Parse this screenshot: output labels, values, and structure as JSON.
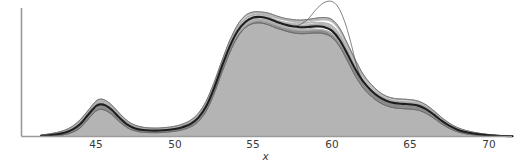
{
  "chart_data": {
    "type": "area",
    "title": "",
    "subtitle": "",
    "xlabel": "x",
    "ylabel": "",
    "xlim": [
      41.5,
      71.5
    ],
    "ylim": [
      0,
      1.0
    ],
    "xticks": [
      45,
      50,
      55,
      60,
      65,
      70
    ],
    "xtick_labels": [
      "45",
      "50",
      "55",
      "60",
      "65",
      "70"
    ],
    "yticks": [],
    "ytick_labels": [],
    "grid": false,
    "legend": null,
    "annotations": [],
    "series": [
      {
        "name": "median density",
        "role": "central-curve",
        "color": "#1e1e1e",
        "linewidth": 2.2,
        "x": [
          41.5,
          42.0,
          42.5,
          43.0,
          43.5,
          44.0,
          44.5,
          45.0,
          45.3,
          45.6,
          46.0,
          46.5,
          47.0,
          47.5,
          48.0,
          48.5,
          49.0,
          49.5,
          50.0,
          50.5,
          51.0,
          51.5,
          52.0,
          52.5,
          53.0,
          53.5,
          54.0,
          54.5,
          55.0,
          55.5,
          56.0,
          56.5,
          57.0,
          57.5,
          58.0,
          58.5,
          59.0,
          59.5,
          60.0,
          60.5,
          61.0,
          61.5,
          62.0,
          62.5,
          63.0,
          63.5,
          64.0,
          64.5,
          65.0,
          65.5,
          66.0,
          66.5,
          67.0,
          67.5,
          68.0,
          68.5,
          69.0,
          69.5,
          70.0,
          70.5,
          71.0,
          71.5
        ],
        "y": [
          0.005,
          0.01,
          0.018,
          0.03,
          0.055,
          0.1,
          0.175,
          0.245,
          0.258,
          0.25,
          0.215,
          0.15,
          0.095,
          0.065,
          0.052,
          0.048,
          0.048,
          0.052,
          0.06,
          0.075,
          0.1,
          0.15,
          0.24,
          0.385,
          0.56,
          0.72,
          0.845,
          0.92,
          0.955,
          0.96,
          0.945,
          0.92,
          0.9,
          0.885,
          0.878,
          0.88,
          0.885,
          0.88,
          0.85,
          0.775,
          0.66,
          0.54,
          0.44,
          0.37,
          0.318,
          0.285,
          0.268,
          0.262,
          0.258,
          0.248,
          0.22,
          0.175,
          0.125,
          0.085,
          0.055,
          0.036,
          0.024,
          0.016,
          0.01,
          0.006,
          0.004,
          0.002
        ]
      },
      {
        "name": "bootstrap envelope (upper)",
        "role": "band-upper",
        "color": "#6e6e6e",
        "linewidth": 0.5,
        "y": [
          0.012,
          0.02,
          0.032,
          0.05,
          0.082,
          0.135,
          0.21,
          0.285,
          0.3,
          0.29,
          0.252,
          0.185,
          0.125,
          0.09,
          0.074,
          0.068,
          0.068,
          0.073,
          0.082,
          0.1,
          0.13,
          0.185,
          0.282,
          0.43,
          0.605,
          0.768,
          0.895,
          0.972,
          1.0,
          1.0,
          0.99,
          0.968,
          0.95,
          0.94,
          0.935,
          0.94,
          0.95,
          0.955,
          0.94,
          0.87,
          0.745,
          0.615,
          0.5,
          0.42,
          0.36,
          0.322,
          0.305,
          0.3,
          0.296,
          0.284,
          0.254,
          0.206,
          0.152,
          0.106,
          0.072,
          0.05,
          0.035,
          0.024,
          0.016,
          0.01,
          0.006,
          0.004
        ]
      },
      {
        "name": "bootstrap envelope (lower)",
        "role": "band-lower",
        "color": "#6e6e6e",
        "linewidth": 0.5,
        "y": [
          0.0,
          0.003,
          0.008,
          0.016,
          0.034,
          0.07,
          0.14,
          0.205,
          0.218,
          0.21,
          0.178,
          0.118,
          0.07,
          0.045,
          0.034,
          0.031,
          0.031,
          0.035,
          0.042,
          0.054,
          0.076,
          0.12,
          0.202,
          0.34,
          0.512,
          0.672,
          0.798,
          0.874,
          0.908,
          0.912,
          0.896,
          0.87,
          0.85,
          0.834,
          0.826,
          0.828,
          0.832,
          0.826,
          0.796,
          0.722,
          0.606,
          0.486,
          0.39,
          0.324,
          0.276,
          0.246,
          0.23,
          0.224,
          0.22,
          0.212,
          0.186,
          0.146,
          0.1,
          0.064,
          0.038,
          0.022,
          0.013,
          0.008,
          0.005,
          0.002,
          0.001,
          0.0
        ]
      },
      {
        "name": "outlier replicate",
        "role": "outlier-curve",
        "color": "#555555",
        "linewidth": 0.6,
        "x": [
          57.5,
          58.0,
          58.5,
          59.0,
          59.5,
          60.0,
          60.4,
          60.8,
          61.2,
          61.6,
          62.0
        ],
        "y": [
          0.88,
          0.9,
          0.945,
          1.02,
          1.075,
          1.085,
          1.04,
          0.93,
          0.76,
          0.56,
          0.43
        ]
      }
    ],
    "fill": {
      "name": "central shaded region",
      "color": "#b4b4b4",
      "opacity": 1.0
    },
    "modes": [
      {
        "x": 45.3,
        "height": 0.258,
        "label": "minor mode"
      },
      {
        "x": 55.4,
        "height": 0.96,
        "label": "major mode"
      },
      {
        "x": 59.0,
        "height": 0.885,
        "label": "secondary shoulder"
      },
      {
        "x": 64.8,
        "height": 0.26,
        "label": "right shoulder"
      }
    ]
  },
  "axes": {
    "x_label": "x",
    "tick_labels": [
      "45",
      "50",
      "55",
      "60",
      "65",
      "70"
    ],
    "axis_color": "#8a8a8a"
  }
}
